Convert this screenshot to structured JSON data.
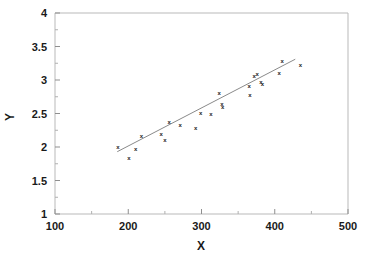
{
  "chart_data": {
    "type": "scatter",
    "title": "",
    "xlabel": "X",
    "ylabel": "Y",
    "xlim": [
      100,
      500
    ],
    "ylim": [
      1,
      4
    ],
    "xticks": [
      100,
      200,
      300,
      400,
      500
    ],
    "yticks": [
      1,
      1.5,
      2,
      2.5,
      3,
      3.5,
      4
    ],
    "xtick_labels": [
      "100",
      "200",
      "300",
      "400",
      "500"
    ],
    "ytick_labels": [
      "1",
      "1.5",
      "2",
      "2.5",
      "3",
      "3.5",
      "4"
    ],
    "minor_ticks": true,
    "grid": false,
    "legend": null,
    "marker": "x",
    "marker_color": "#1c1c1c",
    "frame_color": "#b9b9b9",
    "line_color": "#8a8a8a",
    "series": [
      {
        "name": "observations",
        "points": [
          [
            186,
            2.0
          ],
          [
            201,
            1.84
          ],
          [
            210,
            1.98
          ],
          [
            218,
            2.16
          ],
          [
            245,
            2.2
          ],
          [
            250,
            2.11
          ],
          [
            256,
            2.38
          ],
          [
            271,
            2.33
          ],
          [
            292,
            2.29
          ],
          [
            299,
            2.51
          ],
          [
            313,
            2.5
          ],
          [
            324,
            2.81
          ],
          [
            328,
            2.64
          ],
          [
            329,
            2.6
          ],
          [
            365,
            2.92
          ],
          [
            366,
            2.78
          ],
          [
            372,
            3.07
          ],
          [
            376,
            3.09
          ],
          [
            381,
            2.98
          ],
          [
            383,
            2.94
          ],
          [
            406,
            3.11
          ],
          [
            410,
            3.28
          ],
          [
            435,
            3.23
          ]
        ]
      }
    ],
    "fit_line": {
      "name": "regression-line",
      "x_start": 185,
      "y_start": 1.93,
      "x_end": 428,
      "y_end": 3.31
    }
  },
  "axis": {
    "y_title": "Y",
    "x_title": "X"
  }
}
